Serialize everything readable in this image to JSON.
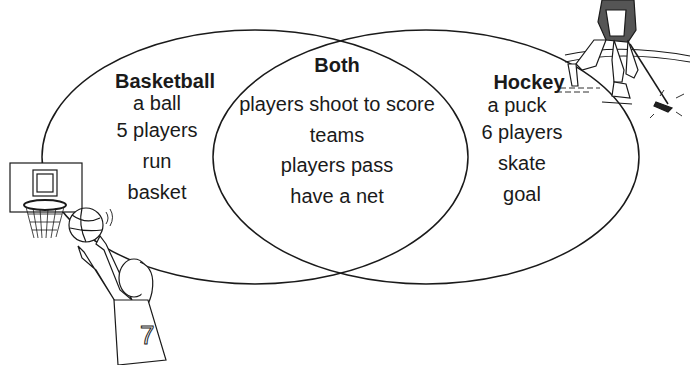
{
  "diagram": {
    "type": "venn",
    "sets": [
      {
        "title": "Basketball",
        "items": [
          "a ball",
          "5 players",
          "run",
          "basket"
        ]
      },
      {
        "title": "Both",
        "items": [
          "players shoot to score",
          "teams",
          "players pass",
          "have a net"
        ]
      },
      {
        "title": "Hockey",
        "items": [
          "a puck",
          "6 players",
          "skate",
          "goal"
        ]
      }
    ],
    "illustrations": {
      "left": "basketball player shooting at hoop",
      "right": "hockey player skating with stick and puck",
      "jersey_number": "7"
    },
    "colors": {
      "line": "#1a1a1a",
      "background": "#ffffff"
    }
  }
}
